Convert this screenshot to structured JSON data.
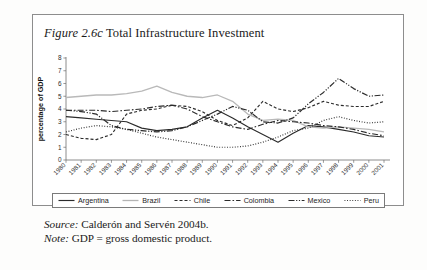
{
  "figure": {
    "number": "Figure 2.6c",
    "title": "Total Infrastructure Investment"
  },
  "source": {
    "lead": "Source:",
    "text": " Calderón and Servén 2004b."
  },
  "note": {
    "lead": "Note:",
    "text": " GDP = gross domestic product."
  },
  "legend": {
    "items": [
      {
        "label": "Argentina",
        "style": "solid-dark",
        "color": "#2b2b2b"
      },
      {
        "label": "Brazil",
        "style": "solid-light",
        "color": "#b4b4b4"
      },
      {
        "label": "Chile",
        "style": "dashed",
        "color": "#2b2b2b"
      },
      {
        "label": "Colombia",
        "style": "dash-dot",
        "color": "#2b2b2b"
      },
      {
        "label": "Mexico",
        "style": "dash-dot-dot",
        "color": "#2b2b2b"
      },
      {
        "label": "Peru",
        "style": "dotted",
        "color": "#2b2b2b"
      }
    ]
  },
  "chart_data": {
    "type": "line",
    "title": "Total Infrastructure Investment",
    "xlabel": "",
    "ylabel": "percentage of GDP",
    "ylim": [
      0,
      8
    ],
    "ytick_step": 1,
    "yticks": [
      0,
      1,
      2,
      3,
      4,
      5,
      6,
      7,
      8
    ],
    "grid": false,
    "legend_position": "bottom",
    "categories": [
      "1980",
      "1981",
      "1982",
      "1983",
      "1984",
      "1985",
      "1986",
      "1987",
      "1988",
      "1989",
      "1990",
      "1991",
      "1992",
      "1993",
      "1994",
      "1995",
      "1996",
      "1997",
      "1998",
      "1999",
      "2000",
      "2001"
    ],
    "x": [
      1980,
      1981,
      1982,
      1983,
      1984,
      1985,
      1986,
      1987,
      1988,
      1989,
      1990,
      1991,
      1992,
      1993,
      1994,
      1995,
      1996,
      1997,
      1998,
      1999,
      2000,
      2001
    ],
    "series": [
      {
        "name": "Argentina",
        "dash": "none",
        "color": "#2b2b2b",
        "width": 1.15,
        "values": [
          3.4,
          3.3,
          3.2,
          3.1,
          3.0,
          2.5,
          2.3,
          2.4,
          2.6,
          3.3,
          3.9,
          3.3,
          2.6,
          2.0,
          1.4,
          2.1,
          2.7,
          2.6,
          2.4,
          2.2,
          1.9,
          1.8
        ]
      },
      {
        "name": "Brazil",
        "dash": "none",
        "color": "#b9b9b9",
        "width": 1.3,
        "values": [
          4.9,
          5.0,
          5.1,
          5.1,
          5.2,
          5.4,
          5.8,
          5.3,
          5.0,
          4.9,
          5.1,
          4.6,
          3.6,
          3.1,
          3.2,
          3.1,
          2.6,
          2.5,
          2.6,
          2.5,
          2.4,
          2.2
        ]
      },
      {
        "name": "Chile",
        "dash": "3,2",
        "color": "#2b2b2b",
        "width": 1.15,
        "values": [
          2.0,
          1.7,
          1.6,
          2.0,
          3.6,
          3.9,
          4.0,
          4.3,
          4.2,
          3.8,
          3.1,
          2.7,
          3.3,
          4.6,
          4.0,
          3.8,
          4.1,
          4.6,
          4.3,
          4.2,
          4.2,
          4.6
        ]
      },
      {
        "name": "Colombia",
        "dash": "6,2,1.6,2",
        "color": "#2b2b2b",
        "width": 1.15,
        "values": [
          3.9,
          3.9,
          3.9,
          3.8,
          3.9,
          4.0,
          4.2,
          4.3,
          4.0,
          3.4,
          3.0,
          2.6,
          2.4,
          2.8,
          3.1,
          3.0,
          2.9,
          2.7,
          2.6,
          2.4,
          2.1,
          1.9
        ]
      },
      {
        "name": "Mexico",
        "dash": "6,1.6,1.2,1.6,1.2,1.6",
        "color": "#2b2b2b",
        "width": 1.2,
        "values": [
          3.9,
          3.8,
          3.6,
          2.7,
          2.4,
          2.3,
          2.2,
          2.3,
          2.6,
          3.1,
          3.6,
          4.2,
          3.9,
          3.0,
          2.9,
          3.3,
          4.4,
          5.3,
          6.4,
          5.6,
          5.0,
          5.1
        ]
      },
      {
        "name": "Peru",
        "dash": "0.9,1.7",
        "color": "#2b2b2b",
        "width": 1.2,
        "values": [
          2.2,
          2.5,
          2.7,
          2.6,
          2.4,
          2.1,
          1.8,
          1.6,
          1.4,
          1.2,
          1.0,
          1.0,
          1.1,
          1.4,
          1.8,
          2.3,
          2.5,
          3.1,
          3.4,
          3.1,
          2.9,
          3.0
        ]
      }
    ]
  }
}
